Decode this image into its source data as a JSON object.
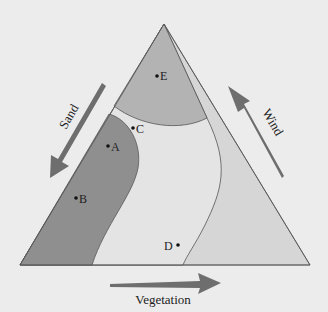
{
  "diagram": {
    "type": "ternary-triangle",
    "colors": {
      "background": "#ececec",
      "outer": "#d6d6d6",
      "middle": "#e3e3e3",
      "top_region": "#b3b3b3",
      "left_region": "#8f8f8f",
      "arrow": "#6e6e6e",
      "line": "#555555"
    },
    "arrows": {
      "sand": "Sand",
      "wind": "Wind",
      "vegetation": "Vegetation"
    },
    "points": [
      {
        "label": "E",
        "x": 157,
        "y": 76
      },
      {
        "label": "C",
        "x": 133,
        "y": 128
      },
      {
        "label": "A",
        "x": 108,
        "y": 146
      },
      {
        "label": "B",
        "x": 76,
        "y": 198
      },
      {
        "label": "D",
        "x": 178,
        "y": 245
      }
    ]
  }
}
